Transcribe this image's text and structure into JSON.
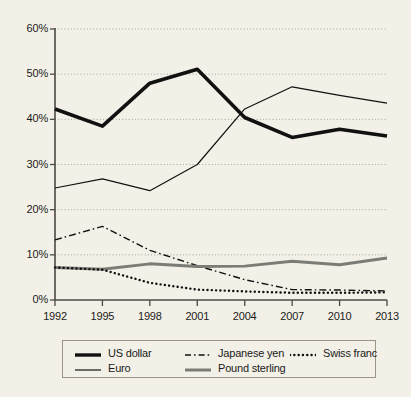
{
  "chart_data": {
    "type": "line",
    "title": "",
    "subtitle": "",
    "xlabel": "",
    "ylabel": "",
    "categories": [
      "1992",
      "1995",
      "1998",
      "2001",
      "2004",
      "2007",
      "2010",
      "2013"
    ],
    "x": [
      1992,
      1995,
      1998,
      2001,
      2004,
      2007,
      2010,
      2013
    ],
    "xlim": [
      1992,
      2013
    ],
    "ylim": [
      0,
      60
    ],
    "y_tick_labels": [
      "0%",
      "10%",
      "20%",
      "30%",
      "40%",
      "50%",
      "60%"
    ],
    "y_tick_values": [
      0,
      10,
      20,
      30,
      40,
      50,
      60
    ],
    "grid": "horizontal-dotted",
    "legend_position": "bottom",
    "series": [
      {
        "name": "US dollar",
        "style": "solid-thick",
        "color": "#111111",
        "width": 3.6,
        "values": [
          42.3,
          38.5,
          48.0,
          51.1,
          40.4,
          36.0,
          37.8,
          36.3
        ]
      },
      {
        "name": "Euro",
        "style": "solid-thin",
        "color": "#111111",
        "width": 1.2,
        "values": [
          24.8,
          26.8,
          24.2,
          30.0,
          42.3,
          47.2,
          45.3,
          43.6
        ]
      },
      {
        "name": "Japanese yen",
        "style": "dash-dot",
        "color": "#111111",
        "width": 1.4,
        "values": [
          13.3,
          16.3,
          11.0,
          7.6,
          4.5,
          2.3,
          2.2,
          2.0
        ]
      },
      {
        "name": "Pound sterling",
        "style": "solid-thick-gray",
        "color": "#7c7c76",
        "width": 3.0,
        "values": [
          7.2,
          6.8,
          8.0,
          7.4,
          7.5,
          8.6,
          7.8,
          9.3
        ]
      },
      {
        "name": "Swiss franc",
        "style": "dotted",
        "color": "#111111",
        "width": 2.4,
        "values": [
          7.2,
          6.7,
          3.8,
          2.3,
          1.9,
          1.6,
          1.6,
          1.7
        ]
      }
    ]
  },
  "axes": {
    "y_ticks": [
      {
        "label": "60%",
        "value": 60
      },
      {
        "label": "50%",
        "value": 50
      },
      {
        "label": "40%",
        "value": 40
      },
      {
        "label": "30%",
        "value": 30
      },
      {
        "label": "20%",
        "value": 20
      },
      {
        "label": "10%",
        "value": 10
      },
      {
        "label": "0%",
        "value": 0
      }
    ],
    "x_ticks": [
      {
        "label": "1992"
      },
      {
        "label": "1995"
      },
      {
        "label": "1998"
      },
      {
        "label": "2001"
      },
      {
        "label": "2004"
      },
      {
        "label": "2007"
      },
      {
        "label": "2010"
      },
      {
        "label": "2013"
      }
    ]
  },
  "legend": {
    "items": [
      {
        "label": "US dollar",
        "style": "solid-thick",
        "color": "#111111"
      },
      {
        "label": "Japanese yen",
        "style": "dash-dot",
        "color": "#111111"
      },
      {
        "label": "Swiss franc",
        "style": "dotted",
        "color": "#111111"
      },
      {
        "label": "Euro",
        "style": "solid-thin",
        "color": "#111111"
      },
      {
        "label": "Pound sterling",
        "style": "solid-thick-gray",
        "color": "#7c7c76"
      }
    ]
  },
  "colors": {
    "background": "#f3f1e7",
    "axis": "#4a4a44",
    "grid": "#9a9a92",
    "ink": "#111111",
    "gray_series": "#7c7c76"
  }
}
